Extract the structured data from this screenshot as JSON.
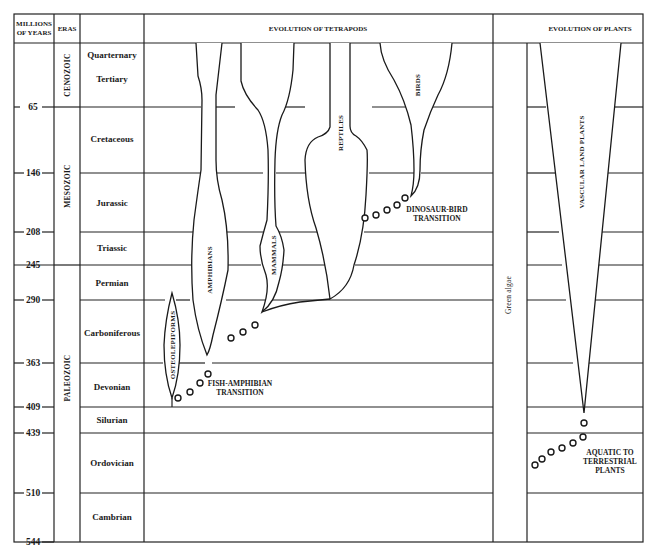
{
  "header": {
    "col_years": [
      "MILLIONS",
      "OF YEARS"
    ],
    "col_eras": "ERAS",
    "col_tetrapods": "EVOLUTION OF TETRAPODS",
    "col_plants": "EVOLUTION OF PLANTS"
  },
  "time_ticks": [
    "65",
    "146",
    "208",
    "245",
    "290",
    "363",
    "409",
    "439",
    "510",
    "544"
  ],
  "eras": [
    {
      "name": "CENOZOIC"
    },
    {
      "name": "MESOZOIC"
    },
    {
      "name": "PALEOZOIC"
    }
  ],
  "periods": [
    {
      "name": "Quarternary"
    },
    {
      "name": "Tertiary"
    },
    {
      "name": "Cretaceous"
    },
    {
      "name": "Jurassic"
    },
    {
      "name": "Triassic"
    },
    {
      "name": "Permian"
    },
    {
      "name": "Carboniferous"
    },
    {
      "name": "Devonian"
    },
    {
      "name": "Silurian"
    },
    {
      "name": "Ordovician"
    },
    {
      "name": "Cambrian"
    }
  ],
  "tetrapods": {
    "clades": [
      "OSTEOLEPIFORMS",
      "AMPHIBIANS",
      "MAMMALS",
      "REPTILES",
      "BIRDS"
    ],
    "transitions": [
      {
        "line1": "FISH-AMPHIBIAN",
        "line2": "TRANSITION"
      },
      {
        "line1": "DINOSAUR-BIRD",
        "line2": "TRANSITION"
      }
    ]
  },
  "plants": {
    "green_algae": "Green algae",
    "vascular": "VASCULAR LAND PLANTS",
    "transition": {
      "line1": "AQUATIC TO",
      "line2": "TERRESTRIAL",
      "line3": "PLANTS"
    }
  },
  "colors": {
    "line": "#222222",
    "background": "#ffffff",
    "text": "#1a1a1a"
  }
}
